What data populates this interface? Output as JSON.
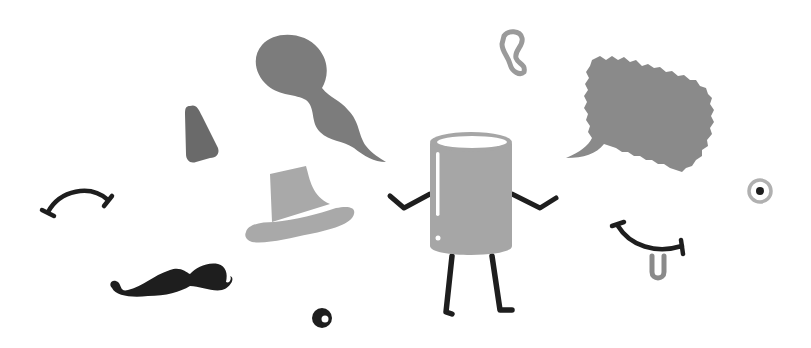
{
  "scene": {
    "description": "Doodle illustration: a cup character with scattered face accessories",
    "background": "#ffffff",
    "colors": {
      "ink": "#1e1e1e",
      "gray_dark": "#6e6e6e",
      "gray_mid": "#808080",
      "gray_light": "#ababab",
      "cup_body": "#a6a6a6",
      "highlight": "#ffffff"
    },
    "items": [
      {
        "name": "cup-character",
        "label": "Cup character with arms and legs"
      },
      {
        "name": "ghost-smoke",
        "label": "Smoke/ghost swirl shape"
      },
      {
        "name": "speech-bubble",
        "label": "Jagged speech bubble"
      },
      {
        "name": "ear",
        "label": "Ear"
      },
      {
        "name": "nose",
        "label": "Triangular nose"
      },
      {
        "name": "eyebrow",
        "label": "Arched eyebrow"
      },
      {
        "name": "hat",
        "label": "Fedora hat"
      },
      {
        "name": "mustache",
        "label": "Curly mustache"
      },
      {
        "name": "small-eye",
        "label": "Small dark eye"
      },
      {
        "name": "target-eye",
        "label": "Ringed eye"
      },
      {
        "name": "smile-tongue",
        "label": "Smile with tongue"
      }
    ]
  }
}
